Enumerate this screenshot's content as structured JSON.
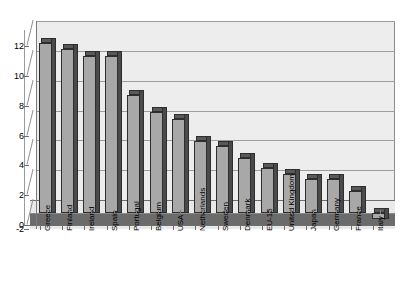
{
  "chart_data": {
    "type": "bar",
    "title": "",
    "subtitle": "",
    "xlabel": "",
    "ylabel": "",
    "ylim": [
      -2,
      12
    ],
    "yticks": [
      -2,
      0,
      2,
      4,
      6,
      8,
      10,
      12
    ],
    "ytick_labels": [
      "-2",
      "0",
      "2",
      "4",
      "6",
      "8",
      "10",
      "12"
    ],
    "grid": true,
    "grid_axis": "y",
    "legend": null,
    "legend_position": "none",
    "style": "3d-bar",
    "categories": [
      "Greece",
      "Finland",
      "Ireland",
      "Spain",
      "Portugal",
      "Belgium",
      "USA",
      "Netherlands",
      "Sweden",
      "Denmark",
      "EU-15",
      "United Kingdom",
      "Japan",
      "Germany",
      "France",
      "Italy"
    ],
    "values": [
      11.4,
      11.0,
      10.5,
      10.5,
      7.9,
      6.8,
      6.3,
      4.8,
      4.5,
      3.7,
      3.0,
      2.6,
      2.3,
      2.3,
      1.5,
      -0.4
    ],
    "colors": {
      "bar_face": "#a8a8a8",
      "bar_side": "#4a4a4a",
      "bar_top": "#595959",
      "bar_outline": "#2e2e2e",
      "negative_face": "#3a3a3a",
      "plot_background": "#eceaea",
      "floor": "#6b6b6b",
      "gridline": "#9d9d9d",
      "axis": "#6e6e6e",
      "text": "#000000",
      "page_background": "#ffffff"
    }
  }
}
